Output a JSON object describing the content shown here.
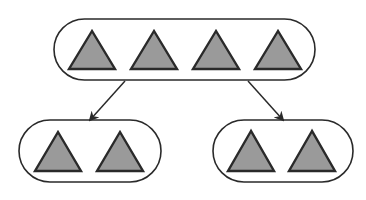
{
  "diagram": {
    "colors": {
      "stroke": "#2a2a2a",
      "triangle_fill": "#9a9a9a",
      "background": "#ffffff"
    },
    "groups": [
      {
        "id": "top-group",
        "shape_count": 4,
        "box": {
          "x": 54,
          "y": 19,
          "w": 261,
          "h": 61
        },
        "triangles": [
          {
            "apex": [
              92,
              31
            ],
            "base_y": 69,
            "half_w": 23
          },
          {
            "apex": [
              154,
              31
            ],
            "base_y": 69,
            "half_w": 23
          },
          {
            "apex": [
              216,
              31
            ],
            "base_y": 69,
            "half_w": 23
          },
          {
            "apex": [
              278,
              31
            ],
            "base_y": 69,
            "half_w": 23
          }
        ]
      },
      {
        "id": "bottom-left-group",
        "shape_count": 2,
        "box": {
          "x": 19,
          "y": 120,
          "w": 142,
          "h": 62
        },
        "triangles": [
          {
            "apex": [
              58,
              132
            ],
            "base_y": 171,
            "half_w": 23
          },
          {
            "apex": [
              120,
              132
            ],
            "base_y": 171,
            "half_w": 23
          }
        ]
      },
      {
        "id": "bottom-right-group",
        "shape_count": 2,
        "box": {
          "x": 213,
          "y": 120,
          "w": 140,
          "h": 62
        },
        "triangles": [
          {
            "apex": [
              251,
              131
            ],
            "base_y": 171,
            "half_w": 23
          },
          {
            "apex": [
              312,
              131
            ],
            "base_y": 171,
            "half_w": 23
          }
        ]
      }
    ],
    "arrows": [
      {
        "id": "arrow-left",
        "from": [
          125,
          81
        ],
        "to": [
          90,
          120
        ]
      },
      {
        "id": "arrow-right",
        "from": [
          248,
          81
        ],
        "to": [
          283,
          120
        ]
      }
    ]
  }
}
